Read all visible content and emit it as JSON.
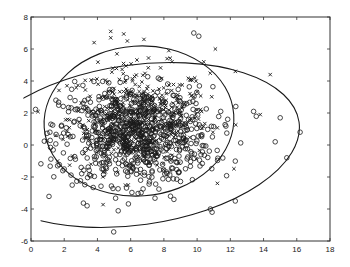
{
  "chart_data": {
    "type": "scatter",
    "title": "",
    "xlabel": "",
    "ylabel": "",
    "xlim": [
      0,
      18
    ],
    "ylim": [
      -6,
      8
    ],
    "xticks": [
      0,
      2,
      4,
      6,
      8,
      10,
      12,
      14,
      16,
      18
    ],
    "yticks": [
      -6,
      -4,
      -2,
      0,
      2,
      4,
      6,
      8
    ],
    "xtick_labels": [
      "0",
      "2",
      "4",
      "6",
      "8",
      "10",
      "12",
      "14",
      "16",
      "18"
    ],
    "ytick_labels": [
      "-6",
      "-4",
      "-2",
      "0",
      "2",
      "4",
      "6",
      "8"
    ],
    "grid": false,
    "legend": null,
    "colors": {
      "ink": "#1a1a1a",
      "axes": "#333333",
      "background": "#ffffff"
    },
    "series": [
      {
        "name": "class-x",
        "marker": "x",
        "count_approx": 420,
        "mean": [
          6.5,
          1.7
        ],
        "std": [
          2.1,
          1.6
        ],
        "outliers": [
          [
            4.8,
            7.1
          ],
          [
            4.8,
            6.7
          ],
          [
            3.8,
            6.4
          ],
          [
            5.8,
            6.5
          ],
          [
            6.8,
            6.6
          ],
          [
            8.3,
            5.9
          ],
          [
            11.1,
            6.0
          ],
          [
            10.4,
            5.2
          ],
          [
            12.3,
            4.6
          ],
          [
            14.4,
            4.4
          ],
          [
            13.8,
            1.9
          ],
          [
            1.6,
            -1.0
          ],
          [
            1.5,
            0.6
          ]
        ]
      },
      {
        "name": "class-o",
        "marker": "o",
        "count_approx": 780,
        "mean": [
          6.3,
          0.6
        ],
        "std": [
          2.3,
          1.5
        ],
        "outliers": [
          [
            9.8,
            7.0
          ],
          [
            10.1,
            6.8
          ],
          [
            13.4,
            2.1
          ],
          [
            15.0,
            1.7
          ],
          [
            16.2,
            0.8
          ],
          [
            14.7,
            0.2
          ],
          [
            15.4,
            -0.8
          ],
          [
            10.8,
            -4.0
          ],
          [
            10.9,
            -4.2
          ],
          [
            8.4,
            -3.2
          ],
          [
            8.6,
            -3.4
          ],
          [
            1.2,
            1.3
          ],
          [
            1.6,
            -1.3
          ],
          [
            2.0,
            -1.5
          ],
          [
            12.3,
            -3.5
          ]
        ]
      }
    ],
    "ellipses": [
      {
        "name": "contour-class-x",
        "center": [
          6.5,
          1.5
        ],
        "semi_axes_px": [
          95,
          75
        ],
        "rotation_deg": -4
      },
      {
        "name": "contour-class-o",
        "center": [
          6.3,
          0.0
        ],
        "semi_axes_px": [
          165,
          80
        ],
        "rotation_deg": -8
      }
    ]
  }
}
